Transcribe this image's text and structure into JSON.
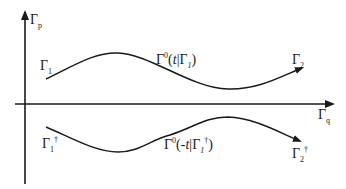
{
  "diagram": {
    "axes": {
      "vertical": {
        "symbol": "Γ",
        "subscript": "p"
      },
      "horizontal": {
        "symbol": "Γ",
        "subscript": "q"
      }
    },
    "upper_path": {
      "start": {
        "symbol": "Γ",
        "subscript": "1"
      },
      "end": {
        "symbol": "Γ",
        "subscript": "2"
      },
      "curve": {
        "symbol": "Γ",
        "superscript": "0",
        "open": "(",
        "var": "t",
        "sep": "|",
        "cond_symbol": "Γ",
        "cond_subscript": "1",
        "close": ")"
      }
    },
    "lower_path": {
      "start": {
        "symbol": "Γ",
        "subscript": "1",
        "superscript": "†"
      },
      "end": {
        "symbol": "Γ",
        "subscript": "2",
        "superscript": "†"
      },
      "curve": {
        "symbol": "Γ",
        "superscript": "0",
        "open": "(-",
        "var": "t",
        "sep": "|",
        "cond_symbol": "Γ",
        "cond_subscript": "1",
        "cond_superscript": "†",
        "close": ")"
      }
    },
    "colors": {
      "stroke": "#1a1a1a",
      "background": "#ffffff"
    }
  }
}
